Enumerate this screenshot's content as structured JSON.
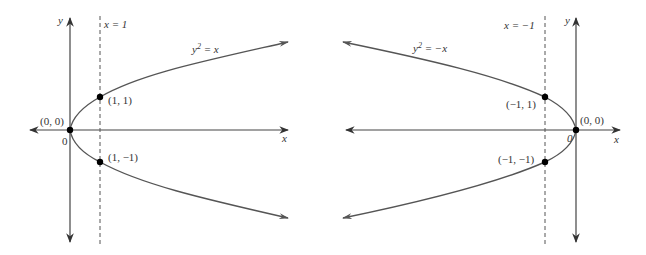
{
  "left_graph": {
    "equation_label": "y² = x",
    "equation_lhs": "y",
    "equation_sup": "2",
    "equation_rhs": " = x",
    "vertical_line_label": "x = 1",
    "axis_x_label": "x",
    "axis_y_label": "y",
    "origin_label": "0",
    "points": [
      {
        "label": "(0, 0)"
      },
      {
        "label": "(1, 1)"
      },
      {
        "label": "(1, −1)"
      }
    ]
  },
  "right_graph": {
    "equation_label": "y² = −x",
    "equation_lhs": "y",
    "equation_sup": "2",
    "equation_rhs": " = −x",
    "vertical_line_label": "x = −1",
    "axis_x_label": "x",
    "axis_y_label": "y",
    "origin_label": "0",
    "points": [
      {
        "label": "(0, 0)"
      },
      {
        "label": "(−1, 1)"
      },
      {
        "label": "(−1, −1)"
      }
    ]
  },
  "colors": {
    "axis": "#444444",
    "curve": "#555555",
    "point": "#000000",
    "text": "#333333"
  }
}
